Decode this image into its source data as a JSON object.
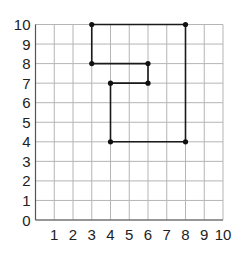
{
  "chart_data": {
    "type": "line",
    "title": "",
    "xlabel": "",
    "ylabel": "",
    "xlim": [
      0,
      10
    ],
    "ylim": [
      0,
      10
    ],
    "grid": true,
    "x_ticks": [
      "1",
      "2",
      "3",
      "4",
      "5",
      "6",
      "7",
      "8",
      "9",
      "10"
    ],
    "y_ticks": [
      "0",
      "1",
      "2",
      "3",
      "4",
      "5",
      "6",
      "7",
      "8",
      "9",
      "10"
    ],
    "series": [
      {
        "name": "path",
        "points": [
          [
            4,
            4
          ],
          [
            8,
            4
          ],
          [
            8,
            10
          ],
          [
            3,
            10
          ],
          [
            3,
            8
          ],
          [
            6,
            8
          ],
          [
            6,
            7
          ],
          [
            4,
            7
          ],
          [
            4,
            4
          ]
        ],
        "closed": false,
        "color": "#1a1a1a"
      }
    ],
    "vertices": [
      [
        3,
        10
      ],
      [
        8,
        10
      ],
      [
        3,
        8
      ],
      [
        6,
        8
      ],
      [
        4,
        7
      ],
      [
        6,
        7
      ],
      [
        4,
        4
      ],
      [
        8,
        4
      ]
    ]
  }
}
